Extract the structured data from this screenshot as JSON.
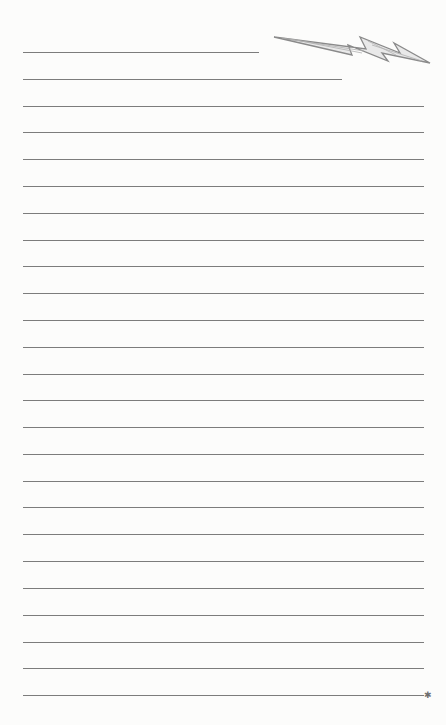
{
  "page": {
    "type": "lined-paper",
    "background": "#fcfcfb",
    "rule_color": "#7c7c7c",
    "rule_left": 23,
    "rule_right": 424,
    "rules": [
      {
        "y": 52,
        "right": 259
      },
      {
        "y": 79,
        "right": 342
      },
      {
        "y": 106
      },
      {
        "y": 132
      },
      {
        "y": 159
      },
      {
        "y": 186
      },
      {
        "y": 213
      },
      {
        "y": 240
      },
      {
        "y": 266
      },
      {
        "y": 293
      },
      {
        "y": 320
      },
      {
        "y": 347
      },
      {
        "y": 374
      },
      {
        "y": 400
      },
      {
        "y": 427
      },
      {
        "y": 454
      },
      {
        "y": 481
      },
      {
        "y": 507
      },
      {
        "y": 534
      },
      {
        "y": 561
      },
      {
        "y": 588
      },
      {
        "y": 615
      },
      {
        "y": 642
      },
      {
        "y": 668
      },
      {
        "y": 695
      }
    ],
    "decorations": {
      "bolt_icon": "lightning-bolt",
      "end_marker": "✱",
      "end_marker_x": 424,
      "end_marker_y": 695
    }
  }
}
